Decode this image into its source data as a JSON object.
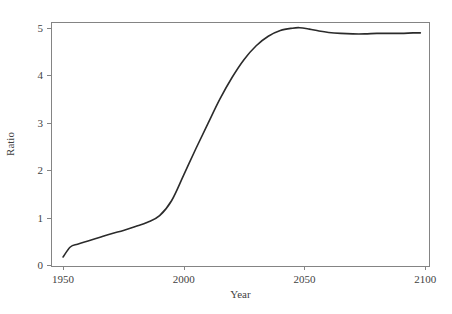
{
  "figure": {
    "background_color": "#ffffff",
    "width": 452,
    "height": 314
  },
  "chart_data": {
    "type": "line",
    "title": "",
    "subtitle": "",
    "xlabel": "Year",
    "ylabel": "Ratio",
    "xlim": [
      1945,
      2102
    ],
    "ylim": [
      -0.02,
      5.12
    ],
    "xticks": [
      1950,
      2000,
      2050,
      2100
    ],
    "xtick_labels": [
      "1950",
      "2000",
      "2050",
      "2100"
    ],
    "yticks": [
      0,
      1,
      2,
      3,
      4,
      5
    ],
    "ytick_labels": [
      "0",
      "1",
      "2",
      "3",
      "4",
      "5"
    ],
    "grid": false,
    "legend": null,
    "legend_position": "none",
    "annotations": [],
    "line_color": "#2b2b2b",
    "line_width": 1.6,
    "axis_color": "#848484",
    "series": [
      {
        "name": "Ratio",
        "x": [
          1950,
          1953,
          1956,
          1960,
          1965,
          1970,
          1975,
          1980,
          1985,
          1990,
          1995,
          2000,
          2005,
          2010,
          2015,
          2020,
          2025,
          2030,
          2035,
          2040,
          2045,
          2048,
          2052,
          2056,
          2060,
          2065,
          2070,
          2075,
          2080,
          2085,
          2090,
          2095,
          2098
        ],
        "y": [
          0.17,
          0.38,
          0.44,
          0.5,
          0.58,
          0.66,
          0.73,
          0.81,
          0.9,
          1.04,
          1.36,
          1.9,
          2.45,
          2.98,
          3.5,
          3.95,
          4.33,
          4.62,
          4.82,
          4.94,
          4.99,
          5.0,
          4.97,
          4.93,
          4.9,
          4.88,
          4.87,
          4.87,
          4.88,
          4.88,
          4.88,
          4.89,
          4.89
        ]
      }
    ]
  },
  "axes_geometry": {
    "left_px": 51,
    "right_px": 430,
    "top_px": 22,
    "bottom_px": 266,
    "tick_length_px": 4
  }
}
